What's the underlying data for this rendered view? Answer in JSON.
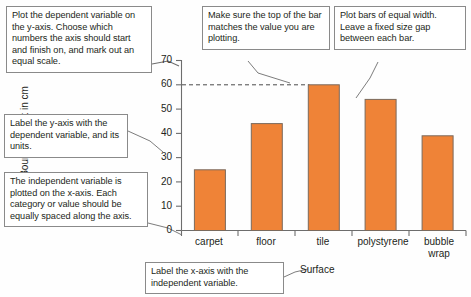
{
  "callouts": {
    "y_scale": "Plot the dependent variable on the y-axis. Choose which numbers the axis should start and finish on, and mark out an equal scale.",
    "y_label": "Label the y-axis with the dependent variable, and its units.",
    "x_spacing": "The independent variable is plotted on the x-axis. Each category or value should be equally spaced along the axis.",
    "bar_top": "Make sure the top of the bar matches the value you are plotting.",
    "bar_width": "Plot bars of equal width. Leave a fixed size gap between each bar.",
    "x_label": "Label the x-axis with the independent variable."
  },
  "chart_data": {
    "type": "bar",
    "title": "",
    "categories": [
      "carpet",
      "floor",
      "tile",
      "polystyrene",
      "bubble wrap"
    ],
    "values": [
      25,
      44,
      60,
      54,
      39
    ],
    "series": [
      {
        "name": "Bounce height",
        "values": [
          25,
          44,
          60,
          54,
          39
        ]
      }
    ],
    "xlabel": "Surface",
    "ylabel": "Bounce height in cm",
    "ylim": [
      0,
      70
    ],
    "ytick_step": 10,
    "yticks": [
      0,
      10,
      20,
      30,
      40,
      50,
      60,
      70
    ],
    "ytick_labels": [
      "0",
      "10",
      "20",
      "30",
      "40",
      "50",
      "60",
      "70"
    ],
    "grid": false,
    "legend": "none",
    "annotations": [
      {
        "name": "reference-line",
        "type": "dashed-horizontal",
        "value": 60,
        "from_category": "axis",
        "to_category": "tile"
      }
    ],
    "bar_color": "#ef8337",
    "bar_edge_color": "#7a6a5d"
  },
  "colors": {
    "bar_fill": "#ef8337",
    "bar_edge": "#7a6a5d",
    "axis": "#6d6d6d",
    "callout_border": "#8a8a8a",
    "leader_line": "#6d6d6d",
    "text": "#231f20"
  }
}
